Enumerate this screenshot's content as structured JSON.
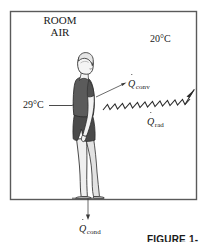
{
  "figure": {
    "kind": "textbook-illustration",
    "frame": {
      "border_color": "#555555",
      "background": "#ffffff"
    },
    "ink_color": "#1a1a1a",
    "labels": {
      "room_air_line1": "ROOM",
      "room_air_line2": "AIR",
      "ambient_temperature": "20°C",
      "skin_temperature": "29°C"
    },
    "heat_flows": [
      {
        "id": "convection",
        "symbol": "Q",
        "subscript": "conv",
        "accent": "dot",
        "arrow_style": "leader-line",
        "direction": "up-right"
      },
      {
        "id": "radiation",
        "symbol": "Q",
        "subscript": "rad",
        "accent": "dot",
        "arrow_style": "zigzag",
        "direction": "right-up"
      },
      {
        "id": "conduction",
        "symbol": "Q",
        "subscript": "cond",
        "accent": "dot",
        "arrow_style": "straight-thin",
        "direction": "down"
      }
    ],
    "person": {
      "pose": "standing-profile-facing-right",
      "shirt_color": "#5b5b5b",
      "shorts_color": "#4a4a4a",
      "skin_color": "#f2f2f2",
      "hair_color": "#e8e8e8",
      "outline_color": "#2b2b2b"
    },
    "caption": "FIGURE 1-12"
  }
}
